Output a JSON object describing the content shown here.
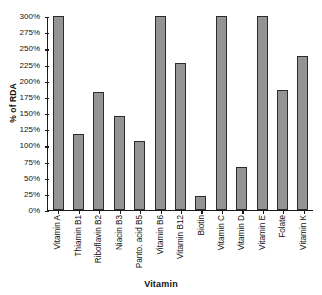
{
  "chart_data": {
    "type": "bar",
    "title": "",
    "xlabel": "Vitamin",
    "ylabel": "% of RDA",
    "ylim": [
      0,
      300
    ],
    "ytick_step": 25,
    "grid": false,
    "legend": false,
    "bar_color": "#949494",
    "bar_border_color": "#2b2b2b",
    "axis_color": "#1a1a1a",
    "categories": [
      "Vitamin A",
      "Thiamin B1",
      "Riboflavin B2",
      "Niacin B3",
      "Panto. acid B5",
      "Vitamin B6",
      "Vitamin B12",
      "Biotin",
      "Vitamin C",
      "Vitamin D",
      "Vitamin E",
      "Folate",
      "Vitamin K"
    ],
    "values": [
      300,
      118,
      182,
      146,
      107,
      300,
      228,
      22,
      300,
      66,
      300,
      185,
      238
    ],
    "ytick_labels": [
      "300%",
      "275%",
      "250%",
      "225%",
      "200%",
      "175%",
      "150%",
      "125%",
      "100%",
      "75%",
      "50%",
      "25%",
      "0%"
    ],
    "ytick_values": [
      300,
      275,
      250,
      225,
      200,
      175,
      150,
      125,
      100,
      75,
      50,
      25,
      0
    ]
  }
}
